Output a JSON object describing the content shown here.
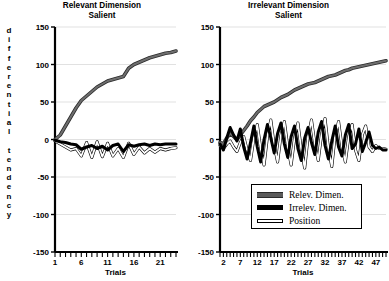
{
  "figure": {
    "y_axis_label": "differential tendency",
    "x_axis_label_left": "Trials",
    "x_axis_label_right": "Trials"
  },
  "legend": {
    "items": [
      {
        "label": "Relev. Dimen.",
        "color": "#5a5a5a",
        "swatch": "relev"
      },
      {
        "label": "Irrelev. Dimen.",
        "color": "#000000",
        "swatch": "irrelev"
      },
      {
        "label": "Position",
        "color": "#ffffff",
        "swatch": "position"
      }
    ]
  },
  "chart_data": [
    {
      "id": "left",
      "type": "line",
      "title": "Relevant Dimension Salient",
      "title_line1": "Relevant Dimension",
      "title_line2": "Salient",
      "xlabel": "Trials",
      "ylabel": "differential tendency",
      "ylim": [
        -150,
        150
      ],
      "yticks": [
        150,
        100,
        50,
        0,
        -50,
        -100,
        -150
      ],
      "ytick_labels": [
        "150",
        "100",
        "50",
        "0",
        "-50",
        "-100",
        "-150"
      ],
      "xlim": [
        1,
        24
      ],
      "xticks": [
        1,
        6,
        11,
        16,
        21
      ],
      "xtick_labels": [
        "1",
        "6",
        "11",
        "16",
        "21"
      ],
      "x_minor_ticks": 24,
      "grid": true,
      "legend_position": "none",
      "x": [
        1,
        2,
        3,
        4,
        5,
        6,
        7,
        8,
        9,
        10,
        11,
        12,
        13,
        14,
        15,
        16,
        17,
        18,
        19,
        20,
        21,
        22,
        23,
        24
      ],
      "series": [
        {
          "name": "Relev. Dimen.",
          "color": "#5a5a5a",
          "values": [
            0,
            6,
            18,
            30,
            42,
            52,
            58,
            64,
            70,
            74,
            78,
            80,
            82,
            84,
            95,
            100,
            103,
            106,
            109,
            111,
            113,
            115,
            116,
            118
          ]
        },
        {
          "name": "Irrelev. Dimen.",
          "color": "#000000",
          "values": [
            -1,
            -3,
            -4,
            -6,
            -7,
            -13,
            -10,
            -8,
            -12,
            -9,
            -14,
            -8,
            -6,
            -16,
            -7,
            -9,
            -7,
            -6,
            -8,
            -6,
            -7,
            -6,
            -6,
            -6
          ]
        },
        {
          "name": "Position",
          "color": "#ffffff",
          "values": [
            -2,
            -6,
            -10,
            -14,
            -12,
            -22,
            -4,
            -24,
            -3,
            -23,
            -5,
            -22,
            -12,
            -24,
            -5,
            -20,
            -10,
            -18,
            -12,
            -17,
            -12,
            -14,
            -12,
            -11
          ]
        }
      ]
    },
    {
      "id": "right",
      "type": "line",
      "title": "Irrelevant Dimension Salient",
      "title_line1": "Irrelevant Dimension",
      "title_line2": "Salient",
      "xlabel": "Trials",
      "ylabel": "differential tendency",
      "ylim": [
        -150,
        150
      ],
      "yticks": [
        150,
        100,
        50,
        0,
        -50,
        -100,
        -150
      ],
      "ytick_labels": [
        "150",
        "100",
        "50",
        "0",
        "-50",
        "-100",
        "-150"
      ],
      "xlim": [
        1,
        50
      ],
      "xticks": [
        2,
        7,
        12,
        17,
        22,
        27,
        32,
        37,
        42,
        47
      ],
      "xtick_labels": [
        "2",
        "7",
        "12",
        "17",
        "22",
        "27",
        "32",
        "37",
        "42",
        "47"
      ],
      "x_minor_ticks": 50,
      "grid": true,
      "legend_position": "bottom-right",
      "x": [
        1,
        2,
        3,
        4,
        5,
        6,
        7,
        8,
        9,
        10,
        11,
        12,
        13,
        14,
        15,
        16,
        17,
        18,
        19,
        20,
        21,
        22,
        23,
        24,
        25,
        26,
        27,
        28,
        29,
        30,
        31,
        32,
        33,
        34,
        35,
        36,
        37,
        38,
        39,
        40,
        41,
        42,
        43,
        44,
        45,
        46,
        47,
        48,
        49,
        50
      ],
      "series": [
        {
          "name": "Relev. Dimen.",
          "color": "#5a5a5a",
          "values": [
            -4,
            -6,
            2,
            8,
            4,
            0,
            6,
            12,
            18,
            25,
            30,
            36,
            40,
            44,
            46,
            48,
            50,
            53,
            56,
            58,
            60,
            63,
            66,
            68,
            70,
            72,
            74,
            75,
            76,
            78,
            80,
            82,
            84,
            85,
            86,
            88,
            90,
            92,
            93,
            95,
            96,
            97,
            98,
            99,
            100,
            101,
            102,
            103,
            104,
            105
          ]
        },
        {
          "name": "Irrelev. Dimen.",
          "color": "#000000",
          "values": [
            -6,
            -14,
            2,
            16,
            6,
            -2,
            14,
            -10,
            -26,
            -4,
            18,
            -10,
            -30,
            0,
            20,
            2,
            -18,
            8,
            22,
            -6,
            -24,
            4,
            18,
            -12,
            -28,
            2,
            16,
            -4,
            -20,
            10,
            24,
            -8,
            -26,
            -2,
            18,
            -10,
            -22,
            6,
            20,
            -12,
            -6,
            14,
            -16,
            -4,
            10,
            -8,
            -12,
            -10,
            -14,
            -14
          ]
        },
        {
          "name": "Position",
          "color": "#ffffff",
          "values": [
            -8,
            -12,
            -6,
            -2,
            -10,
            -16,
            -4,
            4,
            -14,
            -28,
            2,
            20,
            -12,
            -34,
            4,
            26,
            -8,
            -30,
            6,
            24,
            -10,
            -34,
            2,
            22,
            -14,
            -38,
            4,
            26,
            -6,
            -28,
            8,
            28,
            -12,
            -36,
            6,
            24,
            -10,
            -30,
            4,
            20,
            -14,
            -28,
            6,
            18,
            -10,
            -16,
            -8,
            -12,
            -12,
            -13
          ]
        }
      ]
    }
  ]
}
